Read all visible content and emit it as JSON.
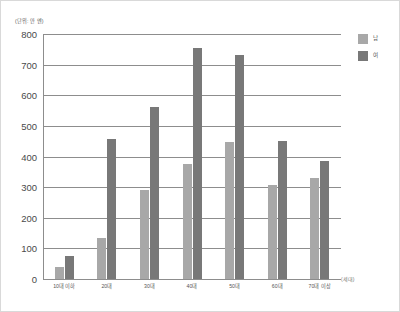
{
  "chart_data": {
    "type": "bar",
    "title": "",
    "subtitle": "",
    "unit_caption": "(단위: 만 엔)",
    "xlabel": "(세대)",
    "ylabel": "",
    "categories": [
      "10대 이하",
      "20대",
      "30대",
      "40대",
      "50대",
      "60대",
      "70대 이상"
    ],
    "series": [
      {
        "name": "남",
        "color": "#a8a8a8",
        "values": [
          40,
          135,
          290,
          375,
          447,
          308,
          330
        ]
      },
      {
        "name": "여",
        "color": "#787878",
        "values": [
          75,
          457,
          563,
          755,
          733,
          450,
          385
        ]
      }
    ],
    "ylim": [
      0,
      800
    ],
    "y_ticks": [
      800,
      700,
      600,
      500,
      400,
      300,
      200,
      100,
      0
    ],
    "grid": "horizontal",
    "legend_position": "right-top"
  },
  "legend": {
    "items": [
      {
        "label": "남",
        "color": "#a8a8a8"
      },
      {
        "label": "여",
        "color": "#787878"
      }
    ]
  },
  "colors": {
    "male_bar": "#a8a8a8",
    "female_bar": "#787878",
    "gridline": "#8d8d8d",
    "frame": "#d9d9d9",
    "text": "#4a4a4a"
  }
}
